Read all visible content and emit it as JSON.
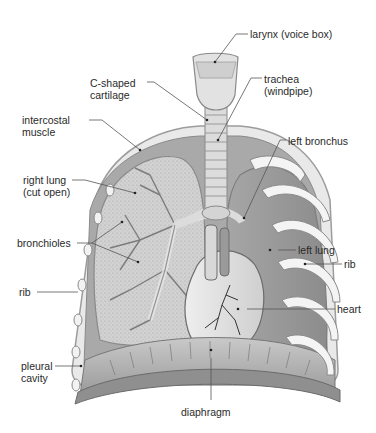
{
  "diagram": {
    "colors": {
      "background": "#ffffff",
      "tissue_light": "#e4e4e4",
      "tissue_mid": "#b9b9b9",
      "tissue_dark": "#8e8e8e",
      "lung_cut": "#cfcfcf",
      "leader": "#555555",
      "text": "#2a2a2a"
    },
    "labels": [
      {
        "id": "larynx",
        "text": "larynx (voice box)"
      },
      {
        "id": "c-shaped-cartilage",
        "text": "C-shaped\ncartilage"
      },
      {
        "id": "trachea",
        "text": "trachea\n(windpipe)"
      },
      {
        "id": "intercostal-muscle",
        "text": "intercostal\nmuscle"
      },
      {
        "id": "left-bronchus",
        "text": "left bronchus"
      },
      {
        "id": "right-lung",
        "text": "right lung\n(cut open)"
      },
      {
        "id": "left-lung",
        "text": "left lung"
      },
      {
        "id": "bronchioles",
        "text": "bronchioles"
      },
      {
        "id": "rib-right",
        "text": "rib"
      },
      {
        "id": "rib-left",
        "text": "rib"
      },
      {
        "id": "heart",
        "text": "heart"
      },
      {
        "id": "pleural-cavity",
        "text": "pleural\ncavity"
      },
      {
        "id": "diaphragm",
        "text": "diaphragm"
      }
    ]
  }
}
